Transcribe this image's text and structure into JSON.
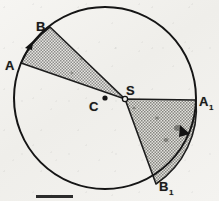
{
  "figure": {
    "background_color": "#f3f2ef",
    "ink_color": "#1a1a1a",
    "shade_color": "#9a9a9a",
    "labels": {
      "A": "A",
      "B": "B",
      "C": "C",
      "S": "S",
      "A1_base": "A",
      "A1_sub": "1",
      "B1_base": "B",
      "B1_sub": "1"
    },
    "geometry": {
      "circle": {
        "cx": 105,
        "cy": 98,
        "r": 91
      },
      "center_point": {
        "label": "C",
        "x": 105,
        "y": 98,
        "marker": "filled-dot"
      },
      "interior_point": {
        "label": "S",
        "x": 125,
        "y": 99,
        "marker": "open-dot"
      },
      "sector_upper_left": {
        "apex": {
          "x": 125,
          "y": 99
        },
        "arc_start": {
          "label": "A",
          "x": 21,
          "y": 63
        },
        "arc_end": {
          "label": "B",
          "x": 50,
          "y": 27
        },
        "arrow_on_arc": {
          "x": 30,
          "y": 45,
          "direction": "counterclockwise"
        }
      },
      "sector_right": {
        "apex": {
          "x": 125,
          "y": 99
        },
        "arc_start": {
          "label": "A1",
          "x": 196,
          "y": 100
        },
        "arc_end": {
          "label": "B1",
          "x": 156,
          "y": 184
        },
        "arrow_on_arc": {
          "x": 186,
          "y": 133,
          "direction": "clockwise"
        }
      }
    },
    "scale_bar": {
      "x": 36,
      "y": 195,
      "width": 37,
      "height": 3
    }
  }
}
